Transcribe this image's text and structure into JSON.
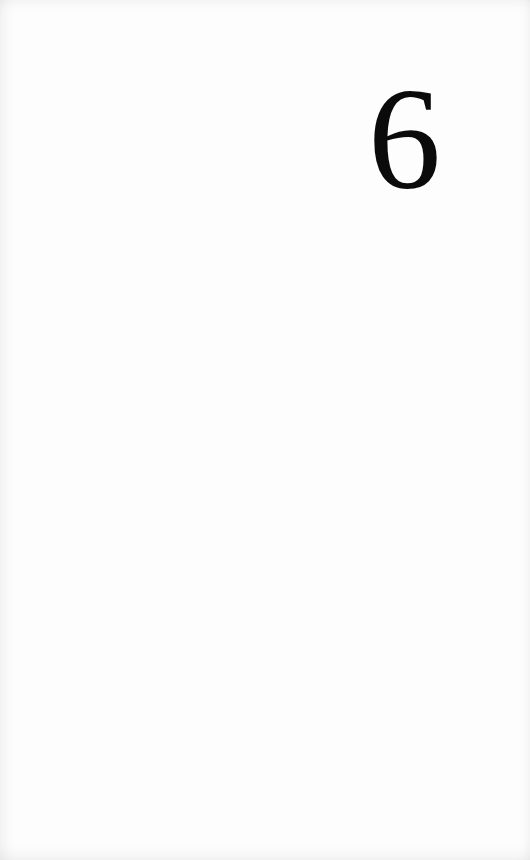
{
  "page": {
    "chapter_number": "6",
    "background_color": "#fdfdfd",
    "text_color": "#0b0b0b"
  }
}
